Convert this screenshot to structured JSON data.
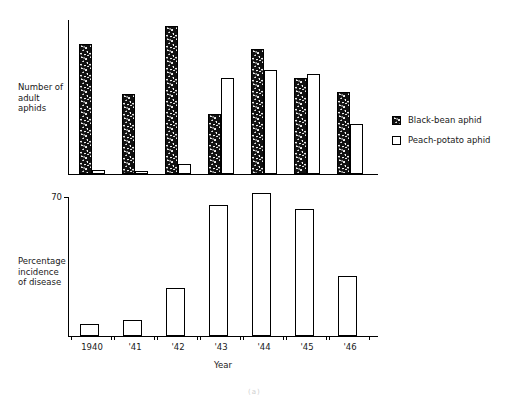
{
  "figure": {
    "top_cut_caption": "",
    "page_artifact": "(a)"
  },
  "legend": {
    "position": "right",
    "items": [
      {
        "label": "Black-bean aphid",
        "swatch": "hatched-swatch",
        "color": "#111111"
      },
      {
        "label": "Peach-potato aphid",
        "swatch": "open-swatch",
        "color": "#ffffff"
      }
    ]
  },
  "chart_data": [
    {
      "id": "aphid-counts",
      "type": "bar",
      "title": "",
      "xlabel": "",
      "ylabel": "Number of\nadult\naphids",
      "categories": [
        "1940",
        "'41",
        "'42",
        "'43",
        "'44",
        "'45",
        "'46"
      ],
      "grid": false,
      "legend_position": "right",
      "ylim": [
        0,
        154
      ],
      "y_ticks": [],
      "series": [
        {
          "name": "Black-bean aphid",
          "values": [
            130,
            80,
            148,
            60,
            125,
            96,
            82
          ]
        },
        {
          "name": "Peach-potato aphid",
          "values": [
            4,
            3,
            10,
            96,
            104,
            100,
            50
          ]
        }
      ]
    },
    {
      "id": "disease-incidence",
      "type": "bar",
      "title": "",
      "xlabel": "Year",
      "ylabel": "Percentage\nincidence\nof disease",
      "categories": [
        "1940",
        "'41",
        "'42",
        "'43",
        "'44",
        "'45",
        "'46"
      ],
      "grid": false,
      "ylim": [
        0,
        75
      ],
      "y_ticks": [
        70
      ],
      "y_tick_labels": [
        "70"
      ],
      "series": [
        {
          "name": "Percentage incidence of disease",
          "values": [
            6,
            8,
            24,
            66,
            72,
            64,
            30
          ]
        }
      ]
    }
  ]
}
